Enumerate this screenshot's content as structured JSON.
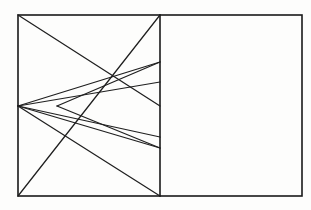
{
  "figure": {
    "background_color": "#fdfdfc",
    "stroke_color": "#1f1f1f",
    "frame_stroke_color": "#1a1a1a",
    "frame_stroke_width": 1.6,
    "ray_stroke_width": 1.25
  },
  "canvas": {
    "width": 311,
    "height": 210
  },
  "chart_data": {
    "type": "line",
    "xlabel": "",
    "ylabel": "",
    "xlim": [
      0,
      311
    ],
    "ylim": [
      0,
      210
    ],
    "grid": false,
    "legend": "none",
    "annotations": [
      "Outer rectangle frame",
      "Vertical divider at x = 160",
      "Convergence point at left edge (18, 106)",
      "Inner V vertex at (57, 106)"
    ]
  },
  "geometry": {
    "outer_rect": {
      "name": "outer-rectangle",
      "x": 18,
      "y": 15,
      "width": 284,
      "height": 181,
      "x2": 302,
      "y2": 196
    },
    "divider": {
      "name": "vertical-divider",
      "x": 160,
      "y1": 15,
      "y2": 196
    },
    "left_panel": {
      "name": "left-panel",
      "x1": 18,
      "y1": 15,
      "x2": 160,
      "y2": 196
    },
    "right_panel": {
      "name": "right-panel",
      "x1": 160,
      "y1": 15,
      "x2": 302,
      "y2": 196,
      "content": "empty"
    },
    "focus_point": {
      "name": "convergence-point",
      "x": 18,
      "y": 106
    },
    "inner_vertex": {
      "name": "inner-v-vertex",
      "x": 57,
      "y": 106
    },
    "segments": [
      {
        "name": "diagonal-top-left-to-mid-right",
        "x1": 18,
        "y1": 15,
        "x2": 160,
        "y2": 106
      },
      {
        "name": "diagonal-bottom-left-to-top-right",
        "x1": 18,
        "y1": 196,
        "x2": 160,
        "y2": 15
      },
      {
        "name": "ray-to-upper-divider-a",
        "x1": 18,
        "y1": 106,
        "x2": 160,
        "y2": 62
      },
      {
        "name": "ray-to-upper-divider-b",
        "x1": 18,
        "y1": 106,
        "x2": 160,
        "y2": 82
      },
      {
        "name": "ray-to-lower-divider-a",
        "x1": 18,
        "y1": 106,
        "x2": 160,
        "y2": 137
      },
      {
        "name": "ray-to-lower-divider-b",
        "x1": 18,
        "y1": 106,
        "x2": 160,
        "y2": 148
      },
      {
        "name": "ray-to-bottom-divider",
        "x1": 18,
        "y1": 106,
        "x2": 160,
        "y2": 196
      },
      {
        "name": "inner-v-upper-arm",
        "x1": 57,
        "y1": 106,
        "x2": 160,
        "y2": 62
      },
      {
        "name": "inner-v-lower-arm",
        "x1": 57,
        "y1": 106,
        "x2": 160,
        "y2": 148
      }
    ]
  }
}
